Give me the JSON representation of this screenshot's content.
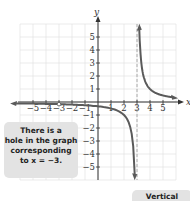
{
  "chart_data": {
    "type": "line",
    "title": "",
    "xlabel": "x",
    "ylabel": "y",
    "xlim": [
      -6,
      6
    ],
    "ylim": [
      -6,
      6
    ],
    "xticks": [
      -5,
      -4,
      -3,
      -2,
      -1,
      1,
      2,
      3,
      4,
      5
    ],
    "yticks": [
      -5,
      -4,
      -3,
      -2,
      -1,
      1,
      2,
      3,
      4,
      5
    ],
    "grid": true,
    "function": "y = 1/(x - 3)",
    "series": [
      {
        "name": "left-branch",
        "x": [
          -6,
          -5,
          -4,
          -3,
          -2,
          -1,
          0,
          1,
          2,
          2.5,
          2.8
        ],
        "y": [
          -0.11,
          -0.125,
          -0.14,
          -0.17,
          -0.2,
          -0.25,
          -0.33,
          -0.5,
          -1,
          -2,
          -5
        ]
      },
      {
        "name": "right-branch",
        "x": [
          3.18,
          3.3,
          3.5,
          4,
          5,
          6
        ],
        "y": [
          5.5,
          3.33,
          2,
          1,
          0.5,
          0.33
        ]
      }
    ],
    "vertical_asymptote": 3,
    "hole": {
      "x": -3
    },
    "colors": {
      "curve": "#5a5a5a",
      "grid": "#dddddd",
      "asymptote": "#999999",
      "axis": "#333333"
    }
  },
  "annotations": {
    "hole_note": [
      "There is a",
      "hole in the graph",
      "corresponding",
      "to x = −3."
    ],
    "asymptote_note": "Vertical"
  }
}
